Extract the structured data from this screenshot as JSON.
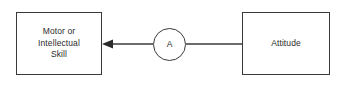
{
  "diagram": {
    "background_color": "#ffffff",
    "stroke_color": "#3a3a3a",
    "text_color": "#2b2b2b",
    "nodes": {
      "skill_box": {
        "label": "Motor or\nIntellectual\nSkill",
        "shape": "rectangle"
      },
      "relation_circle": {
        "label": "A",
        "shape": "circle"
      },
      "attitude_box": {
        "label": "Attitude",
        "shape": "rectangle"
      }
    },
    "edges": {
      "attitude_to_circle": {
        "label": "",
        "arrow": "none"
      },
      "circle_to_skill": {
        "label": "",
        "arrow": "left-filled-triangle"
      }
    }
  }
}
